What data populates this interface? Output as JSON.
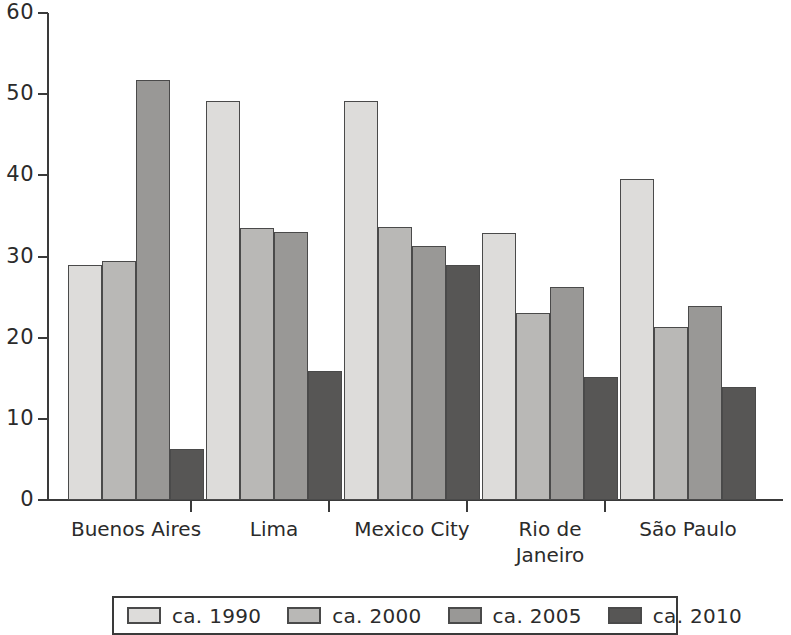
{
  "chart_data": {
    "type": "bar",
    "title": "",
    "subtitle": "",
    "xlabel": "",
    "ylabel": "",
    "ylim": [
      0,
      60
    ],
    "ytick_values": [
      0,
      10,
      20,
      30,
      40,
      50,
      60
    ],
    "ytick_labels": [
      "0",
      "10",
      "20",
      "30",
      "40",
      "50",
      "60"
    ],
    "grid": false,
    "legend_position": "bottom",
    "categories": [
      "Buenos Aires",
      "Lima",
      "Mexico City",
      "Rio de Janeiro",
      "São Paulo"
    ],
    "category_labels": [
      "Buenos Aires",
      "Lima",
      "Mexico City",
      "Rio de\nJaneiro",
      "São Paulo"
    ],
    "series": [
      {
        "name": "ca. 1990",
        "color": "#dddcda",
        "values": [
          28.9,
          49.1,
          49.1,
          32.9,
          39.6
        ]
      },
      {
        "name": "ca. 2000",
        "color": "#b9b8b6",
        "values": [
          29.5,
          33.5,
          33.6,
          23.0,
          21.3
        ]
      },
      {
        "name": "ca. 2005",
        "color": "#999896",
        "values": [
          51.8,
          33.0,
          31.3,
          26.3,
          23.9
        ]
      },
      {
        "name": "ca. 2010",
        "color": "#575655",
        "values": [
          6.3,
          15.9,
          29.0,
          15.1,
          13.9
        ]
      }
    ]
  },
  "legend": {
    "items": [
      {
        "label": "ca. 1990",
        "color": "#dddcda"
      },
      {
        "label": "ca. 2000",
        "color": "#b9b8b6"
      },
      {
        "label": "ca. 2005",
        "color": "#999896"
      },
      {
        "label": "ca. 2010",
        "color": "#575655"
      }
    ]
  },
  "axis": {
    "y_max": 60,
    "y_min": 0,
    "y_step": 10
  }
}
